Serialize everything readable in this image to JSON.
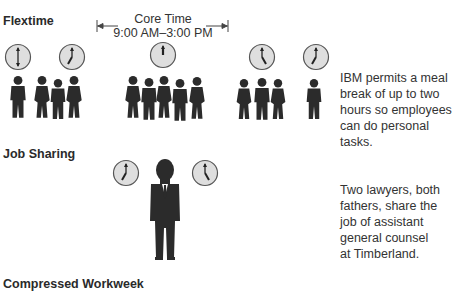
{
  "sections": {
    "flextime": {
      "title": "Flextime",
      "core_time_label": "Core Time",
      "core_time_range": "9:00 AM–3:00 PM",
      "description_lines": [
        "IBM permits a meal",
        "break of up to two",
        "hours so employees",
        "can do personal tasks."
      ],
      "clocks": [
        {
          "time": "6:00",
          "x": 18,
          "y": 57
        },
        {
          "time": "7:00",
          "x": 72,
          "y": 57
        },
        {
          "time": "12:00",
          "x": 163,
          "y": 55
        },
        {
          "time": "5:00",
          "x": 262,
          "y": 57
        },
        {
          "time": "7:00",
          "x": 316,
          "y": 57
        }
      ]
    },
    "job_sharing": {
      "title": "Job Sharing",
      "description_lines": [
        "Two lawyers, both",
        "fathers, share the",
        "job of assistant",
        "general counsel",
        "at Timberland."
      ],
      "clocks": [
        {
          "time": "7:00",
          "x": 126,
          "y": 173
        },
        {
          "time": "5:00",
          "x": 205,
          "y": 173
        }
      ]
    },
    "compressed_workweek": {
      "title": "Compressed Workweek"
    }
  },
  "colors": {
    "figure": "#2b2b2b",
    "clock_face": "#dedede",
    "clock_border": "#555555",
    "text": "#333333"
  }
}
